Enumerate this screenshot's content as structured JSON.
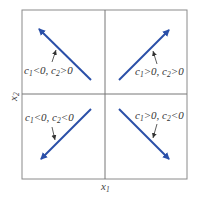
{
  "diagram": {
    "type": "phase-plane quadrant diagram",
    "colors": {
      "arrow": "#2a4fa8",
      "frame": "#8a8a8a",
      "axis": "#777777",
      "text": "#333333"
    },
    "axes": {
      "x_label": {
        "base": "x",
        "sub": "1"
      },
      "y_label": {
        "base": "x",
        "sub": "2"
      }
    },
    "quadrants": [
      {
        "position": "top-left",
        "direction": "up-left",
        "label": {
          "c1": "c",
          "c1_sub": "1",
          "c1_rel": "<0, ",
          "c2": "c",
          "c2_sub": "2",
          "c2_rel": ">0"
        }
      },
      {
        "position": "top-right",
        "direction": "up-right",
        "label": {
          "c1": "c",
          "c1_sub": "1",
          "c1_rel": ">0, ",
          "c2": "c",
          "c2_sub": "2",
          "c2_rel": ">0"
        }
      },
      {
        "position": "bottom-left",
        "direction": "down-left",
        "label": {
          "c1": "c",
          "c1_sub": "1",
          "c1_rel": "<0, ",
          "c2": "c",
          "c2_sub": "2",
          "c2_rel": "<0"
        }
      },
      {
        "position": "bottom-right",
        "direction": "down-right",
        "label": {
          "c1": "c",
          "c1_sub": "1",
          "c1_rel": ">0, ",
          "c2": "c",
          "c2_sub": "2",
          "c2_rel": "<0"
        }
      }
    ]
  }
}
